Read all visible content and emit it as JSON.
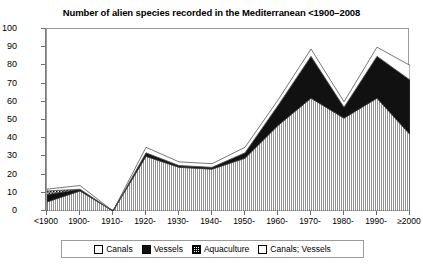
{
  "chart_data": {
    "type": "area",
    "title": "Number of alien species recorded in the Mediterranean <1900–2008",
    "xlabel": "",
    "ylabel": "",
    "ylim": [
      0,
      100
    ],
    "ytick_step": 10,
    "yticks": [
      0,
      10,
      20,
      30,
      40,
      50,
      60,
      70,
      80,
      90,
      100
    ],
    "grid": false,
    "legend_position": "bottom",
    "stacked": true,
    "categories": [
      "<1900",
      "1900-",
      "1910-",
      "1920-",
      "1930-",
      "1940-",
      "1950-",
      "1960-",
      "1970-",
      "1980-",
      "1990-",
      "≥2000"
    ],
    "series": [
      {
        "name": "Canals",
        "pattern": "vertical-lines",
        "values": [
          5,
          11,
          0,
          30,
          24,
          23,
          29,
          47,
          62,
          51,
          62,
          42
        ]
      },
      {
        "name": "Vessels",
        "pattern": "solid-black",
        "values": [
          4,
          1,
          0,
          2,
          1,
          1,
          3,
          11,
          23,
          6,
          23,
          30
        ]
      },
      {
        "name": "Aquaculture",
        "pattern": "checker",
        "values": [
          2,
          0,
          0,
          0,
          0,
          0,
          0,
          0,
          0,
          0,
          0,
          0
        ]
      },
      {
        "name": "Canals; Vessels",
        "pattern": "white",
        "values": [
          1,
          2,
          0,
          3,
          2,
          2,
          3,
          3,
          4,
          3,
          5,
          8
        ]
      }
    ],
    "totals": [
      12,
      14,
      0,
      35,
      27,
      26,
      35,
      61,
      89,
      60,
      90,
      80
    ]
  },
  "legend": {
    "items": [
      {
        "label": "Canals",
        "swatch": "sw-canals",
        "icon": "canals-swatch-icon"
      },
      {
        "label": "Vessels",
        "swatch": "sw-vessels",
        "icon": "vessels-swatch-icon"
      },
      {
        "label": "Aquaculture",
        "swatch": "sw-aqua",
        "icon": "aquaculture-swatch-icon"
      },
      {
        "label": "Canals; Vessels",
        "swatch": "sw-cv",
        "icon": "canals-vessels-swatch-icon"
      }
    ]
  },
  "colors": {
    "canals": "#ffffff",
    "vessels": "#111111",
    "aquaculture": "#ffffff",
    "canals_vessels": "#ffffff",
    "axis": "#7a7a7a",
    "outline": "#3c3c3c",
    "background": "#ffffff"
  }
}
